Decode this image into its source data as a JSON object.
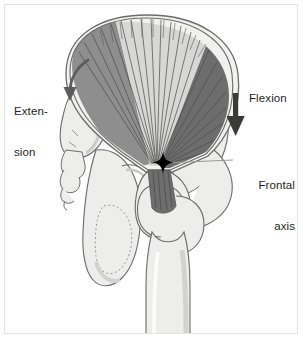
{
  "figure": {
    "background": "#ffffff",
    "border_color": "#e3e3e3"
  },
  "labels": {
    "extension": "Exten-\nsion",
    "extension_line1": "Exten-",
    "extension_line2": "sion",
    "flexion": "Flexion",
    "frontal_axis": "Frontal\naxis",
    "frontal_axis_line1": "Frontal",
    "frontal_axis_line2": "axis"
  },
  "markers": {
    "axis_marker": "four-pointed-star",
    "axis_marker_color": "#000000",
    "leader_line_color": "#9a9a9a"
  },
  "arrows": {
    "extension": {
      "name": "curved-arrow-extension",
      "direction": "down-left-curved",
      "color": "#5c5c5c"
    },
    "flexion": {
      "name": "straight-arrow-flexion",
      "direction": "down",
      "color": "#3a3a3a"
    }
  },
  "anatomy": {
    "muscle_bands": [
      {
        "name": "gluteus-band-posterior",
        "color": "#8f8f8f"
      },
      {
        "name": "gluteus-band-middle",
        "color": "#d8d8d6"
      },
      {
        "name": "gluteus-band-anterior",
        "color": "#6e6e6e"
      }
    ],
    "bone_fill": "#ededeb",
    "bone_shadow": "#d6d6d3",
    "bone_outline": "#6b6b6b",
    "parts": [
      "ilium",
      "sacrum",
      "coccyx",
      "ischium",
      "pubis",
      "femur-head",
      "greater-trochanter",
      "femur-shaft"
    ]
  },
  "colors": {
    "text": "#231f20",
    "muscle_fiber_line": "#5a5a5a",
    "muscle_outline": "#707070"
  }
}
